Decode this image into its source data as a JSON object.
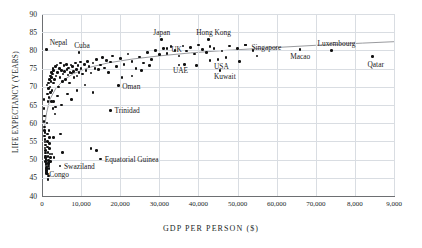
{
  "chart_data": {
    "type": "scatter",
    "title": "",
    "xlabel": "GDP PER PERSON ($)",
    "ylabel": "LIFE EXPECTANCY (YEARS)",
    "xlim": [
      0,
      90000
    ],
    "ylim": [
      40,
      90
    ],
    "grid": true,
    "legend": "none",
    "xticks": [
      "0",
      "10,000",
      "20,000",
      "30,000",
      "40,000",
      "50,000",
      "60,000",
      "70,000",
      "8,000",
      "9,000"
    ],
    "xtick_values": [
      0,
      10000,
      20000,
      30000,
      40000,
      50000,
      60000,
      70000,
      80000,
      90000
    ],
    "yticks": [
      "40",
      "45",
      "50",
      "55",
      "60",
      "65",
      "70",
      "75",
      "80",
      "85",
      "90"
    ],
    "ytick_values": [
      40,
      45,
      50,
      55,
      60,
      65,
      70,
      75,
      80,
      85,
      90
    ],
    "trendline": {
      "present": true,
      "shape": "logarithmic",
      "points": [
        [
          600,
          58.5
        ],
        [
          1200,
          63.0
        ],
        [
          2000,
          66.5
        ],
        [
          3500,
          69.5
        ],
        [
          5500,
          71.8
        ],
        [
          8000,
          73.6
        ],
        [
          12000,
          75.3
        ],
        [
          17000,
          76.6
        ],
        [
          23000,
          77.6
        ],
        [
          30000,
          78.5
        ],
        [
          38000,
          79.3
        ],
        [
          47000,
          80.0
        ],
        [
          58000,
          80.7
        ],
        [
          70000,
          81.4
        ],
        [
          82000,
          82.0
        ],
        [
          90000,
          82.4
        ]
      ]
    },
    "annotated_points": [
      {
        "label": "Nepal",
        "x": 1200,
        "y": 80.3,
        "label_dx": 3,
        "label_dy": -8
      },
      {
        "label": "Cuba",
        "x": 9500,
        "y": 79.5,
        "label_dx": -5,
        "label_dy": -8
      },
      {
        "label": "Japan",
        "x": 30500,
        "y": 83.0,
        "label_dx": -8,
        "label_dy": -8
      },
      {
        "label": "UK",
        "x": 32000,
        "y": 80.5,
        "label_dx": 4,
        "label_dy": -1
      },
      {
        "label": "Hong Kong",
        "x": 42500,
        "y": 83.0,
        "label_dx": -12,
        "label_dy": -8
      },
      {
        "label": "Singapore",
        "x": 52000,
        "y": 81.5,
        "label_dx": 6,
        "label_dy": 1
      },
      {
        "label": "Macao",
        "x": 66000,
        "y": 80.2,
        "label_dx": -10,
        "label_dy": 5
      },
      {
        "label": "Luxembourg",
        "x": 74000,
        "y": 80.0,
        "label_dx": -14,
        "label_dy": -8
      },
      {
        "label": "Qatar",
        "x": 84500,
        "y": 78.3,
        "label_dx": -5,
        "label_dy": 6
      },
      {
        "label": "UAE",
        "x": 35000,
        "y": 76.0,
        "label_dx": -6,
        "label_dy": 4
      },
      {
        "label": "USA",
        "x": 45000,
        "y": 77.5,
        "label_dx": -4,
        "label_dy": 5
      },
      {
        "label": "Kuwait",
        "x": 45500,
        "y": 74.5,
        "label_dx": -6,
        "label_dy": 5
      },
      {
        "label": "Oman",
        "x": 19500,
        "y": 70.3,
        "label_dx": 4,
        "label_dy": -1
      },
      {
        "label": "Trinidad",
        "x": 17500,
        "y": 63.5,
        "label_dx": 4,
        "label_dy": -1
      },
      {
        "label": "Equatorial Guinea",
        "x": 15000,
        "y": 50.2,
        "label_dx": 4,
        "label_dy": -1
      },
      {
        "label": "Swaziland",
        "x": 4600,
        "y": 48.2,
        "label_dx": 4,
        "label_dy": -1
      },
      {
        "label": "Congo",
        "x": 1100,
        "y": 46.5,
        "label_dx": 3,
        "label_dy": 1
      }
    ],
    "points": [
      [
        500,
        66.5
      ],
      [
        600,
        62.0
      ],
      [
        700,
        59.0
      ],
      [
        750,
        57.5
      ],
      [
        800,
        55.5
      ],
      [
        850,
        54.0
      ],
      [
        900,
        52.5
      ],
      [
        950,
        51.0
      ],
      [
        1000,
        50.0
      ],
      [
        1050,
        49.0
      ],
      [
        1100,
        48.0
      ],
      [
        1150,
        47.0
      ],
      [
        1200,
        46.2
      ],
      [
        520,
        64.0
      ],
      [
        560,
        60.5
      ],
      [
        640,
        58.0
      ],
      [
        680,
        56.5
      ],
      [
        720,
        54.8
      ],
      [
        780,
        53.2
      ],
      [
        820,
        51.8
      ],
      [
        880,
        50.6
      ],
      [
        920,
        49.4
      ],
      [
        980,
        48.6
      ],
      [
        1020,
        47.6
      ],
      [
        1080,
        47.0
      ],
      [
        1300,
        60.0
      ],
      [
        1350,
        57.0
      ],
      [
        1400,
        55.0
      ],
      [
        1450,
        53.5
      ],
      [
        1500,
        52.0
      ],
      [
        1550,
        50.8
      ],
      [
        1600,
        49.8
      ],
      [
        1650,
        49.0
      ],
      [
        1700,
        48.2
      ],
      [
        1750,
        47.5
      ],
      [
        1800,
        58.0
      ],
      [
        1850,
        56.0
      ],
      [
        1900,
        54.5
      ],
      [
        1950,
        53.0
      ],
      [
        2000,
        51.5
      ],
      [
        2100,
        50.5
      ],
      [
        2200,
        49.5
      ],
      [
        1250,
        70.5
      ],
      [
        1400,
        68.0
      ],
      [
        1500,
        66.0
      ],
      [
        1600,
        69.5
      ],
      [
        1700,
        71.0
      ],
      [
        1800,
        67.0
      ],
      [
        1900,
        72.0
      ],
      [
        2000,
        70.0
      ],
      [
        2100,
        73.0
      ],
      [
        2200,
        68.5
      ],
      [
        2300,
        71.5
      ],
      [
        2400,
        74.0
      ],
      [
        2500,
        72.5
      ],
      [
        2600,
        69.0
      ],
      [
        2700,
        73.5
      ],
      [
        2800,
        75.0
      ],
      [
        2900,
        71.0
      ],
      [
        3000,
        74.5
      ],
      [
        3200,
        72.0
      ],
      [
        3400,
        75.5
      ],
      [
        3600,
        73.0
      ],
      [
        3800,
        76.0
      ],
      [
        4000,
        74.0
      ],
      [
        4200,
        70.0
      ],
      [
        4400,
        75.0
      ],
      [
        4600,
        72.5
      ],
      [
        4800,
        76.5
      ],
      [
        5000,
        74.5
      ],
      [
        5200,
        71.5
      ],
      [
        5400,
        73.5
      ],
      [
        5600,
        75.8
      ],
      [
        5800,
        74.2
      ],
      [
        6000,
        72.0
      ],
      [
        6200,
        76.2
      ],
      [
        6400,
        74.8
      ],
      [
        6600,
        73.2
      ],
      [
        6800,
        75.2
      ],
      [
        7000,
        71.0
      ],
      [
        7200,
        74.0
      ],
      [
        7400,
        76.0
      ],
      [
        7600,
        73.8
      ],
      [
        7800,
        75.5
      ],
      [
        8000,
        74.2
      ],
      [
        8200,
        72.5
      ],
      [
        8500,
        76.5
      ],
      [
        8800,
        74.8
      ],
      [
        9000,
        73.0
      ],
      [
        9200,
        75.8
      ],
      [
        9500,
        74.0
      ],
      [
        9800,
        76.8
      ],
      [
        10000,
        75.0
      ],
      [
        10400,
        73.5
      ],
      [
        10800,
        76.2
      ],
      [
        11200,
        74.5
      ],
      [
        11600,
        77.0
      ],
      [
        12000,
        75.5
      ],
      [
        12500,
        73.8
      ],
      [
        13000,
        76.5
      ],
      [
        13500,
        75.0
      ],
      [
        14000,
        77.5
      ],
      [
        14500,
        74.8
      ],
      [
        15000,
        76.0
      ],
      [
        15500,
        78.0
      ],
      [
        16000,
        75.2
      ],
      [
        16500,
        77.2
      ],
      [
        17000,
        74.0
      ],
      [
        17500,
        76.8
      ],
      [
        18000,
        78.5
      ],
      [
        19000,
        75.5
      ],
      [
        20000,
        77.8
      ],
      [
        21000,
        76.2
      ],
      [
        22000,
        79.0
      ],
      [
        23000,
        77.0
      ],
      [
        24000,
        75.0
      ],
      [
        25000,
        78.2
      ],
      [
        26000,
        76.5
      ],
      [
        27000,
        79.5
      ],
      [
        28000,
        77.5
      ],
      [
        29000,
        80.0
      ],
      [
        30000,
        78.8
      ],
      [
        31000,
        80.5
      ],
      [
        32000,
        79.2
      ],
      [
        33000,
        81.0
      ],
      [
        34000,
        80.0
      ],
      [
        35000,
        78.5
      ],
      [
        36000,
        81.2
      ],
      [
        37000,
        79.8
      ],
      [
        38000,
        80.8
      ],
      [
        39000,
        79.0
      ],
      [
        40000,
        81.5
      ],
      [
        41000,
        80.2
      ],
      [
        42000,
        79.5
      ],
      [
        43000,
        81.0
      ],
      [
        44000,
        80.5
      ],
      [
        46000,
        79.8
      ],
      [
        48000,
        81.2
      ],
      [
        50000,
        80.5
      ],
      [
        52000,
        81.5
      ],
      [
        54000,
        80.0
      ],
      [
        3000,
        66.0
      ],
      [
        3500,
        64.5
      ],
      [
        4000,
        67.5
      ],
      [
        5000,
        65.0
      ],
      [
        6500,
        68.0
      ],
      [
        7500,
        66.5
      ],
      [
        9000,
        69.0
      ],
      [
        11000,
        70.5
      ],
      [
        13000,
        68.5
      ],
      [
        14000,
        52.5
      ],
      [
        12500,
        53.0
      ],
      [
        5200,
        52.0
      ],
      [
        4800,
        57.0
      ],
      [
        2600,
        51.5
      ],
      [
        2900,
        56.0
      ],
      [
        3100,
        50.5
      ],
      [
        1500,
        44.5
      ],
      [
        1600,
        45.5
      ],
      [
        1400,
        46.0
      ],
      [
        1300,
        47.5
      ],
      [
        1700,
        49.0
      ],
      [
        2400,
        66.0
      ],
      [
        2800,
        64.0
      ],
      [
        3300,
        62.5
      ],
      [
        20500,
        72.5
      ],
      [
        23000,
        73.0
      ],
      [
        25500,
        74.5
      ],
      [
        27500,
        75.8
      ],
      [
        36500,
        76.2
      ],
      [
        39500,
        75.8
      ],
      [
        43000,
        77.2
      ],
      [
        47000,
        78.0
      ],
      [
        55000,
        78.5
      ],
      [
        50500,
        77.0
      ]
    ]
  }
}
